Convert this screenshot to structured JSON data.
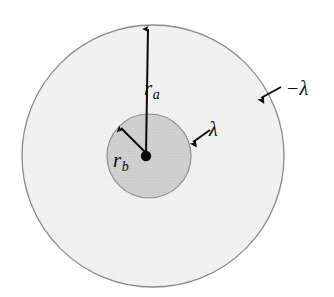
{
  "figure": {
    "type": "physics-cross-section-diagram",
    "background_color": "#ffffff",
    "geometry": {
      "center": {
        "x": 150,
        "y": 156
      },
      "outer_circle": {
        "name": "outer-conductor",
        "center": {
          "x": 153,
          "y": 156
        },
        "radius": 131,
        "fill_color": "#f0f0f0",
        "stroke_color": "#8a8a8a",
        "stroke_width": 1.3
      },
      "inner_circle": {
        "name": "inner-conductor",
        "center": {
          "x": 149,
          "y": 156
        },
        "radius": 42,
        "fill_color": "#cfcfcf",
        "stroke_color": "#8a8a8a",
        "stroke_width": 1.2
      },
      "center_dot": {
        "center": {
          "x": 146,
          "y": 156
        },
        "radius": 5,
        "fill_color": "#0a0a0a"
      }
    },
    "arrows": {
      "radius_outer": {
        "name": "radius-a-arrow",
        "from": {
          "x": 146,
          "y": 154
        },
        "to": {
          "x": 148,
          "y": 25
        },
        "color": "#0a0a0a",
        "width": 2.0
      },
      "radius_inner": {
        "name": "radius-b-arrow",
        "from": {
          "x": 145,
          "y": 152
        },
        "to": {
          "x": 119,
          "y": 125
        },
        "color": "#0a0a0a",
        "width": 2.0
      },
      "charge_inner": {
        "name": "lambda-pointer-arrow",
        "from": {
          "x": 210,
          "y": 130
        },
        "to": {
          "x": 190,
          "y": 144
        },
        "color": "#0a0a0a",
        "width": 1.9
      },
      "charge_outer": {
        "name": "negative-lambda-pointer-arrow",
        "from": {
          "x": 281,
          "y": 87
        },
        "to": {
          "x": 258,
          "y": 99
        },
        "color": "#0a0a0a",
        "width": 1.9
      }
    },
    "labels": {
      "radius_outer": {
        "symbol": "r",
        "subscript": "a"
      },
      "radius_inner": {
        "symbol": "r",
        "subscript": "b"
      },
      "charge_inner": "λ",
      "charge_outer": "−λ"
    }
  }
}
